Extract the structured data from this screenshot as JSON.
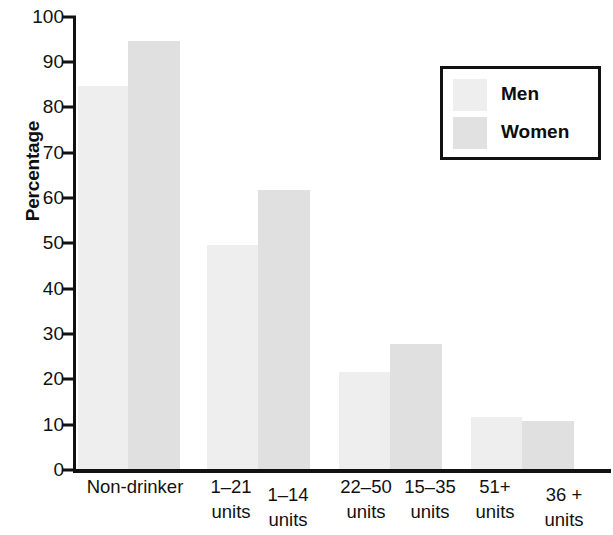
{
  "chart_data": {
    "type": "bar",
    "title": "",
    "xlabel": "",
    "ylabel": "Percentage",
    "ylim": [
      0,
      100
    ],
    "ytick_labels": [
      "0",
      "10",
      "20",
      "30",
      "40",
      "50",
      "60",
      "70",
      "80",
      "90",
      "100"
    ],
    "ytick_values": [
      0,
      10,
      20,
      30,
      40,
      50,
      60,
      70,
      80,
      90,
      100
    ],
    "grid": false,
    "legend_position": "top-right",
    "legend": [
      "Men",
      "Women"
    ],
    "groups": [
      {
        "men_label": "Non-drinker",
        "women_label": "",
        "group_label": "Non-drinker",
        "single_label": true
      },
      {
        "men_label": "1–21\nunits",
        "women_label": "1–14\nunits",
        "single_label": false
      },
      {
        "men_label": "22–50\nunits",
        "women_label": "15–35\nunits",
        "single_label": false
      },
      {
        "men_label": "51+\nunits",
        "women_label": "36 +\nunits",
        "single_label": false
      }
    ],
    "categories": [
      "Non-drinker",
      "1–21 units / 1–14 units",
      "22–50 units / 15–35 units",
      "51+ units / 36 + units"
    ],
    "series": [
      {
        "name": "Men",
        "color": "#eeeeee",
        "values": [
          84.5,
          49.5,
          21.5,
          11.5
        ]
      },
      {
        "name": "Women",
        "color": "#e0e0e0",
        "values": [
          94.5,
          61.5,
          27.5,
          10.5
        ]
      }
    ]
  },
  "axis": {
    "y_title": "Percentage"
  },
  "legend": {
    "men_label": "Men",
    "women_label": "Women"
  },
  "ticks": {
    "t0": "0",
    "t1": "10",
    "t2": "20",
    "t3": "30",
    "t4": "40",
    "t5": "50",
    "t6": "60",
    "t7": "70",
    "t8": "80",
    "t9": "90",
    "t10": "100"
  },
  "xlabels": {
    "g1": "Non-drinker",
    "g2a": "1–21\nunits",
    "g2b": "1–14\nunits",
    "g3a": "22–50\nunits",
    "g3b": "15–35\nunits",
    "g4a": "51+\nunits",
    "g4b": "36 +\nunits"
  }
}
